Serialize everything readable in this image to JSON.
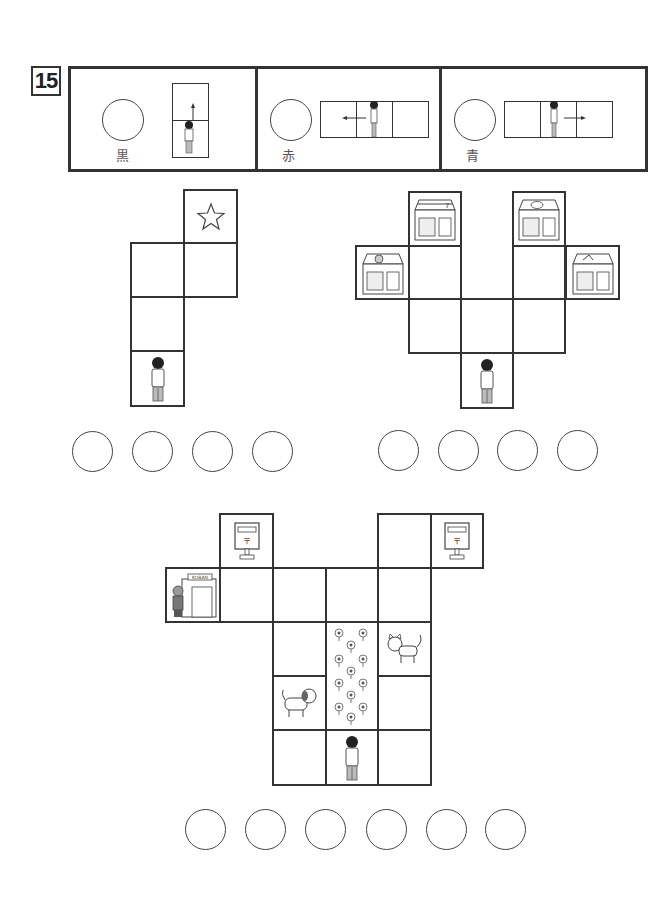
{
  "question_number": "15",
  "legend": {
    "panels": [
      {
        "label": "黒",
        "direction": "forward",
        "arrow": "up"
      },
      {
        "label": "赤",
        "direction": "left",
        "arrow": "left"
      },
      {
        "label": "青",
        "direction": "right",
        "arrow": "right"
      }
    ]
  },
  "puzzles": [
    {
      "id": "puzzle-1",
      "cells": [
        {
          "icon": "star-icon"
        },
        {
          "icon": ""
        },
        {
          "icon": ""
        },
        {
          "icon": ""
        },
        {
          "icon": "person-icon"
        }
      ],
      "answer_circles": 4
    },
    {
      "id": "puzzle-2",
      "cells": [
        {
          "icon": "convenience-store-icon"
        },
        {
          "icon": "fish-shop-icon"
        },
        {
          "icon": "bakery-shop-icon"
        },
        {
          "icon": "flower-shop-icon"
        },
        {
          "icon": "person-icon"
        }
      ],
      "answer_circles": 4
    },
    {
      "id": "puzzle-3",
      "koban_sign": "KOBAN",
      "cells": [
        {
          "icon": "post-box-icon"
        },
        {
          "icon": "post-box-icon"
        },
        {
          "icon": "police-box-icon"
        },
        {
          "icon": "cat-icon"
        },
        {
          "icon": "dog-icon"
        },
        {
          "icon": "flower-bed-icon"
        },
        {
          "icon": "person-icon"
        }
      ],
      "answer_circles": 6
    }
  ]
}
